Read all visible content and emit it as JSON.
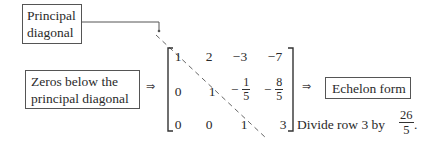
{
  "labels": {
    "principal_line1": "Principal",
    "principal_line2": "diagonal",
    "zeros_line1": "Zeros below the",
    "zeros_line2": "principal diagonal",
    "echelon": "Echelon form",
    "divide_text": "Divide row 3 by",
    "divide_num": "26",
    "divide_den": "5",
    "period": "."
  },
  "arrows": {
    "left": "⇒",
    "right": "⇒"
  },
  "matrix": {
    "row1": [
      "1",
      "2",
      "−3",
      "−7"
    ],
    "row2": {
      "c1": "0",
      "c2": "1",
      "c3_sign": "−",
      "c3_num": "1",
      "c3_den": "5",
      "c4_sign": "−",
      "c4_num": "8",
      "c4_den": "5"
    },
    "row3": [
      "0",
      "0",
      "1",
      "3"
    ]
  },
  "colors": {
    "text": "#2a2a2a",
    "lines": "#555555"
  }
}
